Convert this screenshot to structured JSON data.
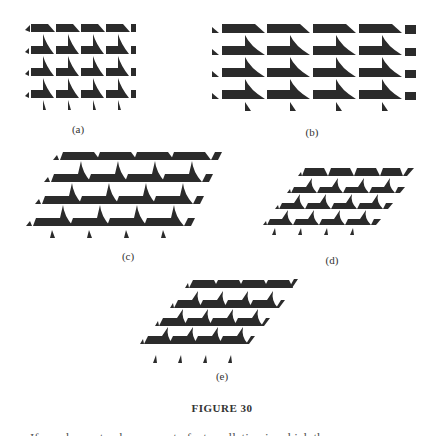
{
  "figure": {
    "caption": "FIGURE 30",
    "panels": [
      {
        "id": "a",
        "label": "(a)",
        "description": "rectangular tiling, narrow tiles, 4x4"
      },
      {
        "id": "b",
        "label": "(b)",
        "description": "rectangular tiling, wide tiles, 4x4"
      },
      {
        "id": "c",
        "label": "(c)",
        "description": "sheared tiling, wide tiles, 4x4"
      },
      {
        "id": "d",
        "label": "(d)",
        "description": "sheared tiling, small tiles, 4x4"
      },
      {
        "id": "e",
        "label": "(e)",
        "description": "sheared tiling, medium tiles, 4x4"
      }
    ]
  },
  "colors": {
    "tile": "#2b2b2b",
    "background": "#ffffff"
  },
  "cut_text": "If we choose to observe part of a tessellation in which the"
}
